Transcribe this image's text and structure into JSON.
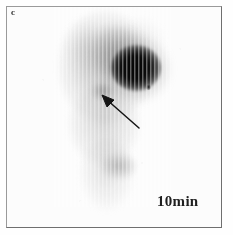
{
  "figure": {
    "panel_label": "c",
    "time_label": "10min",
    "modality": "scintigraphy-anterior-whole-body",
    "background_color": "#fefefe",
    "frame_color": "#9a9a9a",
    "ink_color": "#1f1f1f"
  },
  "annotations": {
    "arrow": {
      "name": "lesion-pointer-arrow",
      "color": "#151515",
      "tip_x": 101,
      "tip_y": 95,
      "tail_x": 138,
      "tail_y": 127
    }
  },
  "findings": [
    {
      "name": "intense-focal-uptake",
      "x": 128,
      "y": 61,
      "intensity": "intense"
    },
    {
      "name": "diffuse-uptake",
      "x": 110,
      "y": 46,
      "intensity": "moderate"
    },
    {
      "name": "arrowed-focal-uptake",
      "x": 96,
      "y": 84,
      "intensity": "faint"
    },
    {
      "name": "small-focal-speck",
      "x": 141,
      "y": 80,
      "intensity": "small-intense"
    },
    {
      "name": "lower-abdominal-uptake",
      "x": 112,
      "y": 159,
      "intensity": "faint"
    }
  ]
}
